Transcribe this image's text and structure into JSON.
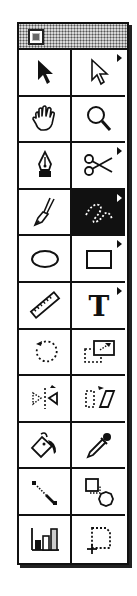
{
  "palette": {
    "title": "",
    "close_box": "close-box",
    "selected_tool": "freehand",
    "tools": [
      {
        "id": "selection",
        "icon": "arrow-icon",
        "label": "Selection",
        "popup": false
      },
      {
        "id": "direct-selection",
        "icon": "hollow-arrow-icon",
        "label": "Direct Selection",
        "popup": true
      },
      {
        "id": "hand",
        "icon": "hand-icon",
        "label": "Hand",
        "popup": false
      },
      {
        "id": "zoom",
        "icon": "magnifier-icon",
        "label": "Zoom",
        "popup": false
      },
      {
        "id": "pen",
        "icon": "pen-nib-icon",
        "label": "Pen",
        "popup": false
      },
      {
        "id": "scissors",
        "icon": "scissors-icon",
        "label": "Scissors",
        "popup": true
      },
      {
        "id": "brush",
        "icon": "brush-icon",
        "label": "Brush",
        "popup": false
      },
      {
        "id": "freehand",
        "icon": "freehand-icon",
        "label": "Freehand",
        "popup": true
      },
      {
        "id": "oval",
        "icon": "oval-icon",
        "label": "Oval",
        "popup": false
      },
      {
        "id": "rectangle",
        "icon": "rectangle-icon",
        "label": "Rectangle",
        "popup": true
      },
      {
        "id": "measure",
        "icon": "ruler-icon",
        "label": "Measure",
        "popup": false
      },
      {
        "id": "type",
        "icon": "type-icon",
        "label": "Type",
        "popup": true
      },
      {
        "id": "rotate",
        "icon": "rotate-icon",
        "label": "Rotate",
        "popup": false
      },
      {
        "id": "scale",
        "icon": "scale-icon",
        "label": "Scale",
        "popup": false
      },
      {
        "id": "reflect",
        "icon": "reflect-icon",
        "label": "Reflect",
        "popup": false
      },
      {
        "id": "shear",
        "icon": "shear-icon",
        "label": "Shear",
        "popup": false
      },
      {
        "id": "paint-bucket",
        "icon": "paint-bucket-icon",
        "label": "Paint Bucket",
        "popup": false
      },
      {
        "id": "eyedropper",
        "icon": "eyedropper-icon",
        "label": "Eyedropper",
        "popup": false
      },
      {
        "id": "blend",
        "icon": "blend-line-icon",
        "label": "Blend",
        "popup": false
      },
      {
        "id": "auto-trace",
        "icon": "auto-trace-icon",
        "label": "Auto Trace",
        "popup": false
      },
      {
        "id": "graph",
        "icon": "bar-graph-icon",
        "label": "Graph",
        "popup": false
      },
      {
        "id": "page",
        "icon": "page-icon",
        "label": "Page",
        "popup": false
      }
    ]
  },
  "colors": {
    "ink": "#111111",
    "paper": "#ffffff",
    "titlebar": "#d8d8d8"
  }
}
